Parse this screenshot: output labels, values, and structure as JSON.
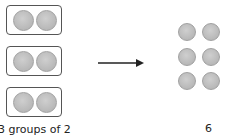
{
  "left_group": {
    "groups": 3,
    "per_group": 2,
    "label": "3 groups of 2"
  },
  "arrow": {
    "direction": "right"
  },
  "right_group": {
    "total": 6,
    "rows": 3,
    "cols": 2,
    "label": "6"
  },
  "colors": {
    "circle_fill": "#c4c4c4",
    "box_border": "#555555",
    "arrow": "#222222"
  }
}
